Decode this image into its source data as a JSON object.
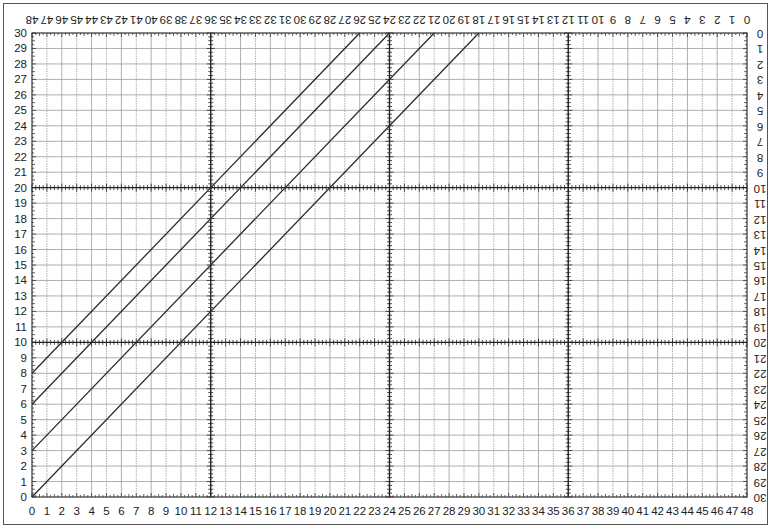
{
  "chart_data": {
    "type": "line",
    "title": "",
    "xlabel": "",
    "ylabel": "",
    "xlim": [
      0,
      48
    ],
    "ylim": [
      0,
      30
    ],
    "grid": true,
    "major_grid_x_every": 12,
    "major_grid_y_every": 10,
    "x_ticks_bottom": [
      0,
      1,
      2,
      3,
      4,
      5,
      6,
      7,
      8,
      9,
      10,
      11,
      12,
      13,
      14,
      15,
      16,
      17,
      18,
      19,
      20,
      21,
      22,
      23,
      24,
      25,
      26,
      27,
      28,
      29,
      30,
      31,
      32,
      33,
      34,
      35,
      36,
      37,
      38,
      39,
      40,
      41,
      42,
      43,
      44,
      45,
      46,
      47,
      48
    ],
    "x_ticks_top_reversed_upside_down": [
      48,
      47,
      46,
      45,
      44,
      43,
      42,
      41,
      40,
      39,
      38,
      37,
      36,
      35,
      34,
      33,
      32,
      31,
      30,
      29,
      28,
      27,
      26,
      25,
      24,
      23,
      22,
      21,
      20,
      19,
      18,
      17,
      16,
      15,
      14,
      13,
      12,
      11,
      10,
      9,
      8,
      7,
      6,
      5,
      4,
      3,
      2,
      1,
      0
    ],
    "y_ticks_left": [
      0,
      1,
      2,
      3,
      4,
      5,
      6,
      7,
      8,
      9,
      10,
      11,
      12,
      13,
      14,
      15,
      16,
      17,
      18,
      19,
      20,
      21,
      22,
      23,
      24,
      25,
      26,
      27,
      28,
      29,
      30
    ],
    "y_ticks_right_reversed_upside_down": [
      30,
      29,
      28,
      27,
      26,
      25,
      24,
      23,
      22,
      21,
      20,
      19,
      18,
      17,
      16,
      15,
      14,
      13,
      12,
      11,
      10,
      9,
      8,
      7,
      6,
      5,
      4,
      3,
      2,
      1,
      0
    ],
    "series": [
      {
        "name": "line-1",
        "x": [
          0,
          30
        ],
        "y": [
          0,
          30
        ]
      },
      {
        "name": "line-2",
        "x": [
          0,
          27
        ],
        "y": [
          3,
          30
        ]
      },
      {
        "name": "line-3",
        "x": [
          0,
          24
        ],
        "y": [
          6,
          30
        ]
      },
      {
        "name": "line-4",
        "x": [
          0,
          22
        ],
        "y": [
          8,
          30
        ]
      }
    ],
    "legend": null,
    "colors": {
      "line": "#2a2a2a",
      "grid_minor": "#9a9a9a",
      "grid_major": "#222222",
      "text": "#222222"
    }
  }
}
